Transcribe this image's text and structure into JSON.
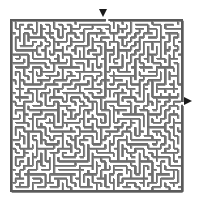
{
  "page": {
    "title": "Maze Puzzle",
    "background_color": "#ffffff",
    "width": 198,
    "height": 208
  },
  "maze": {
    "name": "rectangular-grid-maze",
    "type": "perfect-maze",
    "cols": 40,
    "rows": 40,
    "origin_x": 11,
    "origin_y": 20,
    "cell_size": 4.275,
    "wall_color": "#8c8c8c",
    "wall_shadow_color": "#6e6e6e",
    "border_color": "#5a5a5a",
    "passage_color": "#ffffff",
    "wall_thickness": 1.35,
    "border_thickness": 1.6,
    "seed": 20240517
  },
  "markers": {
    "entrance": {
      "label": "entrance-arrow",
      "direction": "down",
      "color": "#1a1a1a",
      "x": 99,
      "y": 9,
      "size": 9
    },
    "exit": {
      "label": "exit-arrow",
      "direction": "right",
      "color": "#1a1a1a",
      "x": 184,
      "y": 97,
      "size": 9
    }
  }
}
